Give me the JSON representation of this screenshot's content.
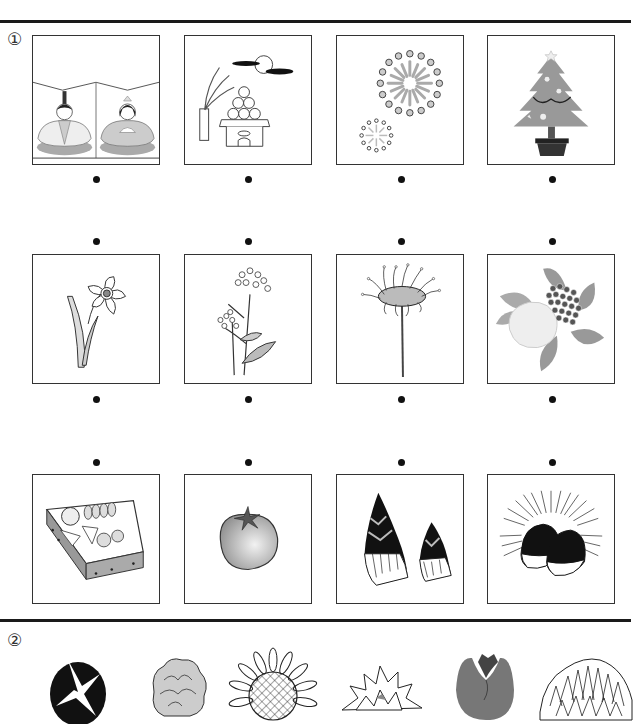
{
  "worksheet": {
    "section1": {
      "label": "①",
      "rows": [
        {
          "row": 1,
          "items": [
            {
              "id": "hina-dolls",
              "label": "Hina dolls (Hinamatsuri)",
              "icon": "hina-dolls-icon"
            },
            {
              "id": "tsukimi",
              "label": "Moon viewing dango and pampas grass",
              "icon": "tsukimi-icon"
            },
            {
              "id": "fireworks",
              "label": "Fireworks",
              "icon": "fireworks-icon"
            },
            {
              "id": "christmas-tree",
              "label": "Christmas tree",
              "icon": "christmas-tree-icon"
            }
          ]
        },
        {
          "row": 2,
          "items": [
            {
              "id": "daffodil",
              "label": "Daffodil",
              "icon": "daffodil-icon"
            },
            {
              "id": "rapeseed",
              "label": "Rapeseed blossom",
              "icon": "rapeseed-icon"
            },
            {
              "id": "red-spider-lily",
              "label": "Red spider lily",
              "icon": "spider-lily-icon"
            },
            {
              "id": "hydrangea",
              "label": "Hydrangea",
              "icon": "hydrangea-icon"
            }
          ]
        },
        {
          "row": 3,
          "items": [
            {
              "id": "osechi",
              "label": "Osechi box",
              "icon": "osechi-box-icon"
            },
            {
              "id": "tomato",
              "label": "Tomato",
              "icon": "tomato-icon"
            },
            {
              "id": "bamboo-shoot",
              "label": "Bamboo shoots",
              "icon": "bamboo-shoot-icon"
            },
            {
              "id": "chestnut",
              "label": "Chestnuts in burr",
              "icon": "chestnut-icon"
            }
          ]
        }
      ]
    },
    "section2": {
      "label": "②",
      "items": [
        {
          "id": "morning-glory",
          "label": "Morning glory",
          "icon": "morning-glory-icon"
        },
        {
          "id": "marigold",
          "label": "Marigold",
          "icon": "marigold-icon"
        },
        {
          "id": "sunflower",
          "label": "Sunflower",
          "icon": "sunflower-icon"
        },
        {
          "id": "dahlia",
          "label": "Dahlia",
          "icon": "dahlia-icon"
        },
        {
          "id": "tulip",
          "label": "Tulip",
          "icon": "tulip-icon"
        },
        {
          "id": "chrysanthemum",
          "label": "Chrysanthemum",
          "icon": "chrysanthemum-icon"
        }
      ]
    },
    "colors": {
      "rule": "#1a1a1a",
      "border": "#333333",
      "dot": "#111111",
      "gray_light": "#d9d9d9",
      "gray_mid": "#a8a8a8",
      "gray_dark": "#555555"
    }
  }
}
